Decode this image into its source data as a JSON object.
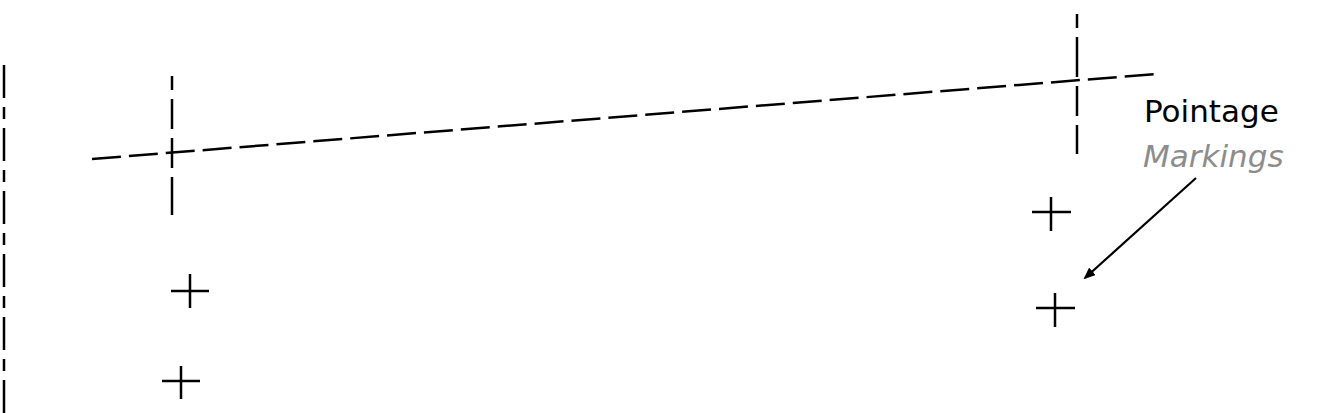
{
  "diagram": {
    "labels": {
      "main": "Pointage",
      "sub": "Markings"
    },
    "colors": {
      "stroke": "#000000",
      "label_main": "#000000",
      "label_sub": "#8c8c8c",
      "background": "#ffffff"
    },
    "lines": [
      {
        "name": "left-edge-centerline",
        "style": "dash-dot",
        "from": [
          4,
          65
        ],
        "to": [
          4,
          413
        ]
      },
      {
        "name": "slanted-centerline",
        "style": "dashed",
        "from": [
          92,
          159
        ],
        "to": [
          1156,
          74
        ]
      },
      {
        "name": "left-vertical-centerline",
        "style": "dashed",
        "from": [
          172,
          76
        ],
        "to": [
          172,
          215
        ]
      },
      {
        "name": "right-vertical-centerline",
        "style": "dashed",
        "from": [
          1077,
          14
        ],
        "to": [
          1077,
          154
        ]
      }
    ],
    "pointage_marks": [
      {
        "x": 190,
        "y": 291
      },
      {
        "x": 181,
        "y": 381
      },
      {
        "x": 1051,
        "y": 212
      },
      {
        "x": 1055,
        "y": 308
      }
    ],
    "arrow": {
      "from": [
        1196,
        178
      ],
      "to": [
        1083,
        280
      ]
    }
  }
}
